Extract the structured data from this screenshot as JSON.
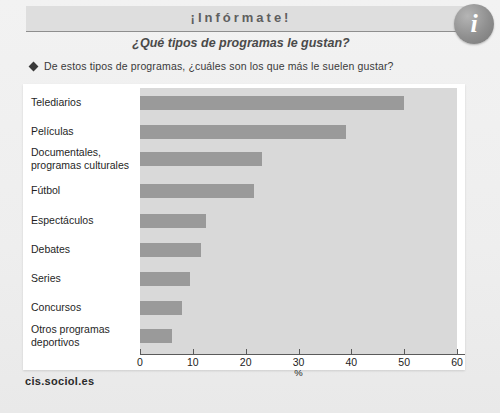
{
  "header": {
    "brand_title": "¡Infórmate!",
    "subtitle": "¿Qué tipos de programas le gustan?",
    "info_icon_letter": "i",
    "question": "De estos tipos de programas, ¿cuáles son los que más le suelen gustar?"
  },
  "footer": {
    "source": "cis.sociol.es"
  },
  "colors": {
    "bar_fill": "#9a9a9a",
    "plot_background": "#d9d9d9",
    "card_background": "#ffffff",
    "page_background": "#eeeeee",
    "axis": "#5a5a5a",
    "header_band": "#dedede"
  },
  "chart_data": {
    "type": "bar",
    "orientation": "horizontal",
    "title": "¿Qué tipos de programas le gustan?",
    "xlabel": "%",
    "ylabel": "",
    "xlim": [
      0,
      60
    ],
    "xticks": [
      0,
      10,
      20,
      30,
      40,
      50,
      60
    ],
    "xtick_labels": [
      "0",
      "10",
      "20",
      "30",
      "40",
      "50",
      "60"
    ],
    "grid": false,
    "legend": null,
    "categories": [
      "Telediarios",
      "Películas",
      "Documentales, programas culturales",
      "Fútbol",
      "Espectáculos",
      "Debates",
      "Series",
      "Concursos",
      "Otros programas deportivos"
    ],
    "category_lines": [
      [
        "Telediarios"
      ],
      [
        "Películas"
      ],
      [
        "Documentales,",
        "programas culturales"
      ],
      [
        "Fútbol"
      ],
      [
        "Espectáculos"
      ],
      [
        "Debates"
      ],
      [
        "Series"
      ],
      [
        "Concursos"
      ],
      [
        "Otros programas",
        "deportivos"
      ]
    ],
    "values": [
      50,
      39,
      23,
      21.5,
      12.5,
      11.5,
      9.5,
      8,
      6
    ]
  }
}
